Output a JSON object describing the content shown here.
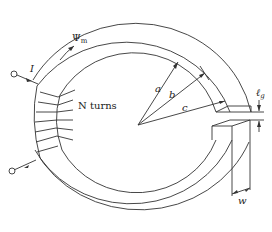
{
  "figure": {
    "type": "toroidal core with air gap",
    "labels": {
      "current": "I",
      "flux": "Ψ",
      "flux_sub": "m",
      "turns": "N turns",
      "radius_a": "a",
      "radius_b": "b",
      "radius_c": "c",
      "gap": "ℓ",
      "gap_sub": "g",
      "width": "w"
    },
    "colors": {
      "line": "#333333",
      "background": "#ffffff"
    }
  }
}
